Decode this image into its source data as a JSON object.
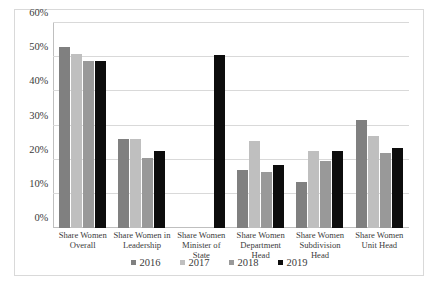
{
  "chart_data": {
    "type": "bar",
    "title": "",
    "xlabel": "",
    "ylabel": "",
    "ylim": [
      0,
      60
    ],
    "ytick_labels": [
      "0%",
      "10%",
      "20%",
      "30%",
      "40%",
      "50%",
      "60%"
    ],
    "ytick_values": [
      0,
      10,
      20,
      30,
      40,
      50,
      60
    ],
    "grid": true,
    "legend_position": "bottom",
    "categories": [
      "Share Women Overall",
      "Share Women in Leadership",
      "Share Women Minister of State",
      "Share Women Department Head",
      "Share Women Subdivision Head",
      "Share Women Unit Head"
    ],
    "series": [
      {
        "name": "2016",
        "color": "#808080",
        "values": [
          53,
          26,
          null,
          17,
          13.5,
          31.5
        ]
      },
      {
        "name": "2017",
        "color": "#bfbfbf",
        "values": [
          51,
          26,
          null,
          25.5,
          22.5,
          27
        ]
      },
      {
        "name": "2018",
        "color": "#999999",
        "values": [
          49,
          20.5,
          null,
          16.5,
          19.5,
          22
        ]
      },
      {
        "name": "2019",
        "color": "#0d0d0d",
        "values": [
          49,
          22.5,
          50.5,
          18.5,
          22.5,
          23.5
        ]
      }
    ]
  }
}
